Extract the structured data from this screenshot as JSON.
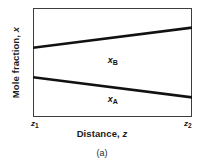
{
  "figure": {
    "caption": "(a)",
    "y_axis": {
      "label_text": "Mole fraction, ",
      "label_symbol": "x"
    },
    "x_axis": {
      "label_text": "Distance, ",
      "label_symbol": "z",
      "start_symbol": "z",
      "start_sub": "1",
      "end_symbol": "z",
      "end_sub": "2"
    },
    "series_labels": {
      "upper_symbol": "x",
      "upper_sub": "B",
      "lower_symbol": "x",
      "lower_sub": "A"
    },
    "colors": {
      "line": "#111111",
      "frame": "#3d3d3d",
      "background": "#ffffff"
    }
  },
  "chart_data": {
    "type": "line",
    "title": "",
    "subtitle": "",
    "xlabel": "Distance, z",
    "ylabel": "Mole fraction, x",
    "caption": "(a)",
    "grid": false,
    "legend": "inline-annotations",
    "xlim": [
      0,
      1
    ],
    "ylim": [
      0,
      1
    ],
    "xtick_labels": [
      "z1",
      "z2"
    ],
    "ytick_labels": [],
    "x": [
      0,
      1
    ],
    "series": [
      {
        "name": "xB",
        "label": "x_B",
        "values": [
          0.635,
          0.82
        ],
        "annotation": "x_B",
        "annotation_x": 0.47,
        "annotation_y": 0.56
      },
      {
        "name": "xA",
        "label": "x_A",
        "values": [
          0.365,
          0.18
        ],
        "annotation": "x_A",
        "annotation_x": 0.47,
        "annotation_y": 0.2
      }
    ]
  }
}
